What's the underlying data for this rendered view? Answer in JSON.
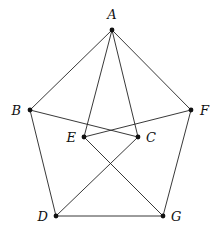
{
  "diagram": {
    "type": "graph",
    "nodes": [
      {
        "id": "A",
        "label": "A",
        "x": 112,
        "y": 30,
        "lx": 112,
        "ly": 19,
        "anchor": "middle"
      },
      {
        "id": "B",
        "label": "B",
        "x": 30,
        "y": 110,
        "lx": 21,
        "ly": 115,
        "anchor": "end"
      },
      {
        "id": "F",
        "label": "F",
        "x": 191,
        "y": 110,
        "lx": 200,
        "ly": 115,
        "anchor": "start"
      },
      {
        "id": "E",
        "label": "E",
        "x": 84,
        "y": 137,
        "lx": 76,
        "ly": 142,
        "anchor": "end"
      },
      {
        "id": "C",
        "label": "C",
        "x": 138,
        "y": 137,
        "lx": 146,
        "ly": 142,
        "anchor": "start"
      },
      {
        "id": "D",
        "label": "D",
        "x": 56,
        "y": 216,
        "lx": 48,
        "ly": 221,
        "anchor": "end"
      },
      {
        "id": "G",
        "label": "G",
        "x": 163,
        "y": 216,
        "lx": 171,
        "ly": 221,
        "anchor": "start"
      }
    ],
    "edges": [
      [
        "A",
        "B"
      ],
      [
        "A",
        "F"
      ],
      [
        "A",
        "E"
      ],
      [
        "A",
        "C"
      ],
      [
        "B",
        "D"
      ],
      [
        "F",
        "G"
      ],
      [
        "D",
        "G"
      ],
      [
        "B",
        "C"
      ],
      [
        "F",
        "E"
      ],
      [
        "E",
        "G"
      ],
      [
        "C",
        "D"
      ]
    ],
    "colors": {
      "stroke": "#222222",
      "node": "#111111",
      "background": "#ffffff"
    }
  }
}
